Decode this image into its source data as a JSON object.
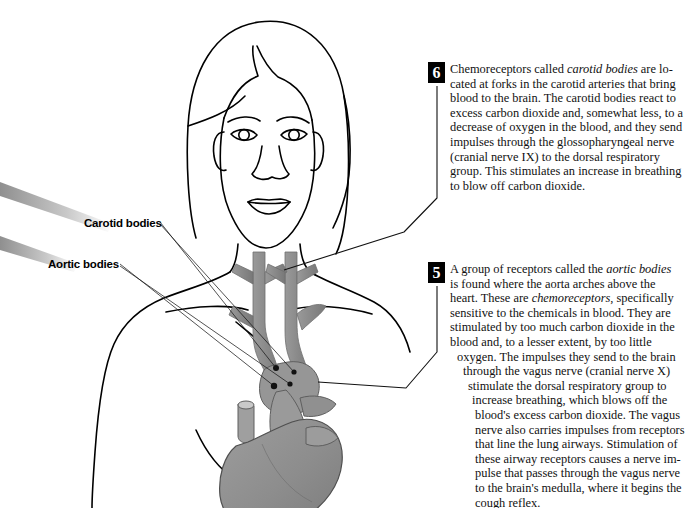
{
  "figure": {
    "colors": {
      "line": "#000000",
      "vessel_gray": "#8c8c8c",
      "heart_gray": "#909090",
      "heart_shadow": "#6f6f6f",
      "band_gray": "#b9b9b9",
      "badge_bg": "#000000",
      "badge_fg": "#ffffff",
      "background": "#ffffff"
    }
  },
  "labels": {
    "carotid": "Carotid bodies",
    "aortic": "Aortic bodies"
  },
  "callouts": [
    {
      "number": "6",
      "id": "callout-6",
      "text_lines": [
        "Chemoreceptors called ",
        "carotid bodies",
        " are lo-",
        "cated at forks in the carotid arteries that bring",
        "blood to the brain. The carotid bodies react to",
        "excess carbon dioxide and, somewhat less, to a",
        "decrease of oxygen in the blood, and they send",
        "impulses through the glossopharyngeal nerve",
        "(cranial nerve IX) to the dorsal respiratory",
        "group. This stimulates an increase in breathing",
        "to blow off carbon dioxide."
      ],
      "full_text": "Chemoreceptors called carotid bodies are located at forks in the carotid arteries that bring blood to the brain. The carotid bodies react to excess carbon dioxide and, somewhat less, to a decrease of oxygen in the blood, and they send impulses through the glossopharyngeal nerve (cranial nerve IX) to the dorsal respiratory group. This stimulates an increase in breathing to blow off carbon dioxide.",
      "italic_terms": [
        "carotid bodies"
      ]
    },
    {
      "number": "5",
      "id": "callout-5",
      "lines": [
        {
          "indent": 0,
          "pre": "A group of receptors called the ",
          "italic": "aortic bodies",
          "post": ""
        },
        {
          "indent": 0,
          "pre": "is found where the aorta arches above the",
          "italic": "",
          "post": ""
        },
        {
          "indent": 0,
          "pre": "heart. These are ",
          "italic": "chemoreceptors",
          "post": ", specifically"
        },
        {
          "indent": 0,
          "pre": "sensitive to the chemicals in blood. They are",
          "italic": "",
          "post": ""
        },
        {
          "indent": 0,
          "pre": "stimulated by too much carbon dioxide in the",
          "italic": "",
          "post": ""
        },
        {
          "indent": 0,
          "pre": "blood and, to a lesser extent, by too little",
          "italic": "",
          "post": ""
        },
        {
          "indent": 1,
          "pre": "oxygen. The impulses they send to the brain",
          "italic": "",
          "post": ""
        },
        {
          "indent": 2,
          "pre": "through the vagus nerve (cranial nerve X)",
          "italic": "",
          "post": ""
        },
        {
          "indent": 3,
          "pre": "stimulate the dorsal respiratory group to",
          "italic": "",
          "post": ""
        },
        {
          "indent": 4,
          "pre": "increase breathing, which blows off the",
          "italic": "",
          "post": ""
        },
        {
          "indent": 5,
          "pre": "blood's excess carbon dioxide. The vagus",
          "italic": "",
          "post": ""
        },
        {
          "indent": 5,
          "pre": "nerve also carries impulses from receptors",
          "italic": "",
          "post": ""
        },
        {
          "indent": 5,
          "pre": "that line the lung airways. Stimulation of",
          "italic": "",
          "post": ""
        },
        {
          "indent": 5,
          "pre": "these airway receptors causes a nerve im-",
          "italic": "",
          "post": ""
        },
        {
          "indent": 5,
          "pre": "pulse that passes through the vagus nerve",
          "italic": "",
          "post": ""
        },
        {
          "indent": 5,
          "pre": "to the brain's medulla, where it begins the",
          "italic": "",
          "post": ""
        },
        {
          "indent": 5,
          "pre": "cough reflex.",
          "italic": "",
          "post": ""
        }
      ],
      "full_text": "A group of receptors called the aortic bodies is found where the aorta arches above the heart. These are chemoreceptors, specifically sensitive to the chemicals in blood. They are stimulated by too much carbon dioxide in the blood and, to a lesser extent, by too little oxygen. The impulses they send to the brain through the vagus nerve (cranial nerve X) stimulate the dorsal respiratory group to increase breathing, which blows off the blood's excess carbon dioxide. The vagus nerve also carries impulses from receptors that line the lung airways. Stimulation of these airway receptors causes a nerve impulse that passes through the vagus nerve to the brain's medulla, where it begins the cough reflex.",
      "italic_terms": [
        "aortic bodies",
        "chemoreceptors"
      ]
    }
  ]
}
